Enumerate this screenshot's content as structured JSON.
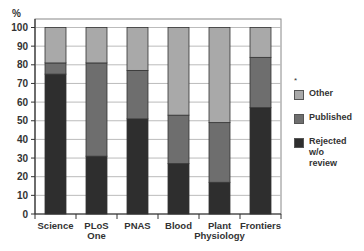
{
  "chart_data": {
    "type": "bar",
    "stacked": true,
    "title": "",
    "xlabel": "",
    "ylabel": "%",
    "ylim": [
      0,
      100
    ],
    "yticks": [
      0,
      10,
      20,
      30,
      40,
      50,
      60,
      70,
      80,
      90,
      100
    ],
    "grid": true,
    "legend_position": "right",
    "categories": [
      "Science",
      "PLoS One",
      "PNAS",
      "Blood",
      "Plant Physiology",
      "Frontiers"
    ],
    "category_labels": [
      [
        "Science"
      ],
      [
        "PLoS",
        "One"
      ],
      [
        "PNAS"
      ],
      [
        "Blood"
      ],
      [
        "Plant",
        "Physiology"
      ],
      [
        "Frontiers"
      ]
    ],
    "series": [
      {
        "name": "Rejected w/o review",
        "color": "#2e2e2e",
        "values": [
          75,
          31,
          51,
          27,
          17,
          57
        ]
      },
      {
        "name": "Published",
        "color": "#6e6e6e",
        "values": [
          6,
          50,
          26,
          26,
          32,
          27
        ]
      },
      {
        "name": "Other",
        "color": "#a9a9a9",
        "values": [
          19,
          19,
          23,
          47,
          51,
          16
        ]
      }
    ],
    "legend": [
      {
        "label": "Other",
        "color": "#a9a9a9"
      },
      {
        "label": "Published",
        "color": "#6e6e6e"
      },
      {
        "label": "Rejected\nw/o review",
        "color": "#2e2e2e"
      }
    ],
    "legend_marker": "*"
  }
}
